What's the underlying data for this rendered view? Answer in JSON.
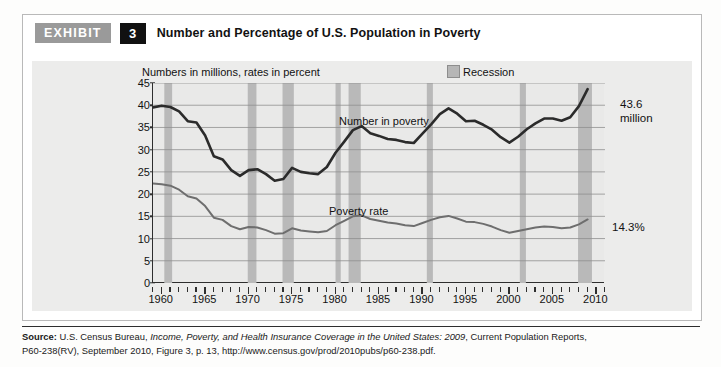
{
  "exhibit": {
    "tag": "EXHIBIT",
    "number": "3",
    "title": "Number and Percentage of U.S. Population in Poverty"
  },
  "chart_panel": {
    "subtitle": "Numbers in millions, rates in percent",
    "legend": {
      "recession_label": "Recession",
      "recession_color": "#b6b6b6"
    }
  },
  "annotations": {
    "number_value": "43.6",
    "number_unit": "million",
    "rate_value": "14.3%"
  },
  "source": {
    "lead": "Source:",
    "line1_a": " U.S. Census Bureau, ",
    "line1_italic": "Income, Poverty, and Health Insurance Coverage in the United States: 2009",
    "line1_b": ", Current Population Reports,",
    "line2": "P60-238(RV), September 2010, Figure 3, p. 13, http://www.census.gov/prod/2010pubs/p60-238.pdf."
  },
  "chart_data": {
    "type": "line",
    "title": "Number and Percentage of U.S. Population in Poverty",
    "subtitle": "Numbers in millions, rates in percent",
    "xlabel": "",
    "ylabel": "",
    "xlim": [
      1959,
      2011
    ],
    "ylim": [
      0,
      45
    ],
    "yticks": [
      0,
      5,
      10,
      15,
      20,
      25,
      30,
      35,
      40,
      45
    ],
    "xticks": [
      1960,
      1965,
      1970,
      1975,
      1980,
      1985,
      1990,
      1995,
      2000,
      2005,
      2010
    ],
    "xtick_labels": [
      "1960",
      "1965",
      "1970",
      "1975",
      "1980",
      "1985",
      "1990",
      "1995",
      "2000",
      "2005",
      "2010"
    ],
    "minor_xtick_interval": 1,
    "grid": "horizontal",
    "legend_position": "top-right",
    "line_colors": {
      "number": "#2b2b2b",
      "rate": "#6e6e6e"
    },
    "x": [
      1959,
      1960,
      1961,
      1962,
      1963,
      1964,
      1965,
      1966,
      1967,
      1968,
      1969,
      1970,
      1971,
      1972,
      1973,
      1974,
      1975,
      1976,
      1977,
      1978,
      1979,
      1980,
      1981,
      1982,
      1983,
      1984,
      1985,
      1986,
      1987,
      1988,
      1989,
      1990,
      1991,
      1992,
      1993,
      1994,
      1995,
      1996,
      1997,
      1998,
      1999,
      2000,
      2001,
      2002,
      2003,
      2004,
      2005,
      2006,
      2007,
      2008,
      2009
    ],
    "series": [
      {
        "name": "Number in poverty",
        "unit": "millions",
        "values": [
          39.5,
          39.9,
          39.6,
          38.6,
          36.4,
          36.1,
          33.2,
          28.5,
          27.8,
          25.4,
          24.1,
          25.4,
          25.6,
          24.5,
          23.0,
          23.4,
          25.9,
          25.0,
          24.7,
          24.5,
          26.1,
          29.3,
          31.8,
          34.4,
          35.3,
          33.7,
          33.1,
          32.4,
          32.2,
          31.7,
          31.5,
          33.6,
          35.7,
          38.0,
          39.3,
          38.1,
          36.4,
          36.5,
          35.6,
          34.5,
          32.8,
          31.6,
          32.9,
          34.6,
          35.9,
          37.0,
          37.0,
          36.5,
          37.3,
          39.8,
          43.6
        ],
        "end_label": "43.6 million"
      },
      {
        "name": "Poverty rate",
        "unit": "percent",
        "values": [
          22.4,
          22.2,
          21.9,
          21.0,
          19.5,
          19.0,
          17.3,
          14.7,
          14.2,
          12.8,
          12.1,
          12.6,
          12.5,
          11.9,
          11.1,
          11.2,
          12.3,
          11.8,
          11.6,
          11.4,
          11.7,
          13.0,
          14.0,
          15.0,
          15.2,
          14.4,
          14.0,
          13.6,
          13.4,
          13.0,
          12.8,
          13.5,
          14.2,
          14.8,
          15.1,
          14.5,
          13.8,
          13.7,
          13.3,
          12.7,
          11.9,
          11.3,
          11.7,
          12.1,
          12.5,
          12.7,
          12.6,
          12.3,
          12.5,
          13.2,
          14.3
        ],
        "end_label": "14.3%"
      }
    ],
    "recessions": [
      {
        "start": 1960.3,
        "end": 1961.2
      },
      {
        "start": 1969.9,
        "end": 1970.9
      },
      {
        "start": 1973.9,
        "end": 1975.2
      },
      {
        "start": 1980.0,
        "end": 1980.6
      },
      {
        "start": 1981.5,
        "end": 1982.9
      },
      {
        "start": 1990.5,
        "end": 1991.2
      },
      {
        "start": 2001.2,
        "end": 2001.9
      },
      {
        "start": 2007.9,
        "end": 2009.5
      }
    ]
  }
}
